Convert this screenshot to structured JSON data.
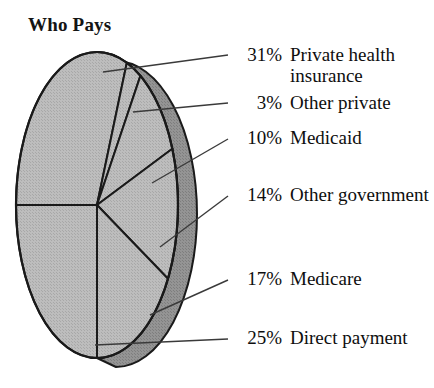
{
  "chart_title": "Who Pays",
  "chart_data": {
    "type": "pie",
    "title": "Who Pays",
    "subtitle": "",
    "xlabel": "",
    "ylabel": "",
    "legend_position": "right-callouts",
    "grid": false,
    "units": "percent",
    "total": 100,
    "style": {
      "three_d": true,
      "face_color": "#b9b9b9",
      "side_color": "#8f8f8f",
      "outline_color": "#1a1a1a",
      "leader_line_color": "#3a3a3a",
      "background": "#ffffff"
    },
    "categories": [
      "Private health insurance",
      "Other private",
      "Medicaid",
      "Other government",
      "Medicare",
      "Direct payment"
    ],
    "values": [
      31,
      3,
      10,
      14,
      17,
      25
    ],
    "slices": [
      {
        "pct_label": "31%",
        "value": 31,
        "name": "Private health insurance",
        "start_angle_deg": 180,
        "end_angle_deg": 291.6
      },
      {
        "pct_label": "3%",
        "value": 3,
        "name": "Other private",
        "start_angle_deg": 291.6,
        "end_angle_deg": 302.4
      },
      {
        "pct_label": "10%",
        "value": 10,
        "name": "Medicaid",
        "start_angle_deg": 302.4,
        "end_angle_deg": 338.4
      },
      {
        "pct_label": "14%",
        "value": 14,
        "name": "Other government",
        "start_angle_deg": 338.4,
        "end_angle_deg": 28.8
      },
      {
        "pct_label": "17%",
        "value": 17,
        "name": "Medicare",
        "start_angle_deg": 28.8,
        "end_angle_deg": 90
      },
      {
        "pct_label": "25%",
        "value": 25,
        "name": "Direct payment",
        "start_angle_deg": 90,
        "end_angle_deg": 180
      }
    ]
  },
  "callouts": [
    {
      "pct": "31%",
      "label": "Private health insurance"
    },
    {
      "pct": "3%",
      "label": "Other private"
    },
    {
      "pct": "10%",
      "label": "Medicaid"
    },
    {
      "pct": "14%",
      "label": "Other government"
    },
    {
      "pct": "17%",
      "label": "Medicare"
    },
    {
      "pct": "25%",
      "label": "Direct payment"
    }
  ]
}
